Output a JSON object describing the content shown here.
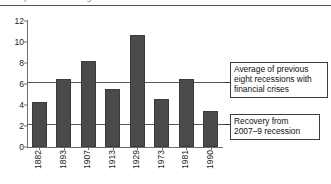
{
  "figure": {
    "clipped_title_fragment": "year recession began",
    "bar_color": "#4a4a4a",
    "axis_color": "#6e6e6e",
    "refline_color": "#5a5a5a"
  },
  "chart_data": {
    "type": "bar",
    "title": "",
    "xlabel": "",
    "ylabel": "",
    "ylim": [
      0,
      12
    ],
    "yticks": [
      0,
      2,
      4,
      6,
      8,
      10,
      12
    ],
    "grid": false,
    "legend": "none",
    "categories": [
      "1882",
      "1893",
      "1907",
      "1913",
      "1929",
      "1973",
      "1981",
      "1990"
    ],
    "values": [
      4.3,
      6.5,
      8.2,
      5.5,
      10.7,
      4.6,
      6.5,
      3.4
    ],
    "reference_lines": [
      {
        "id": "average-eight-recessions",
        "value": 6.2,
        "label": "Average of previous eight recessions with financial crises"
      },
      {
        "id": "recovery-2007-9",
        "value": 2.2,
        "label": "Recovery from 2007–9 recession"
      }
    ],
    "annotations": [
      {
        "id": "callout-average",
        "lines": [
          "Average of previous",
          "eight recessions with",
          "financial crises"
        ]
      },
      {
        "id": "callout-recovery",
        "lines": [
          "Recovery from",
          "2007–9 recession"
        ]
      }
    ]
  },
  "yticks": {
    "t0": "0",
    "t1": "2",
    "t2": "4",
    "t3": "6",
    "t4": "8",
    "t5": "10",
    "t6": "12"
  },
  "xticks": {
    "t0": "1882",
    "t1": "1893",
    "t2": "1907",
    "t3": "1913",
    "t4": "1929",
    "t5": "1973",
    "t6": "1981",
    "t7": "1990"
  },
  "callouts": {
    "average": {
      "line1": "Average of previous",
      "line2": "eight recessions with",
      "line3": "financial crises"
    },
    "recovery": {
      "line1": "Recovery from",
      "line2": "2007–9 recession"
    }
  }
}
